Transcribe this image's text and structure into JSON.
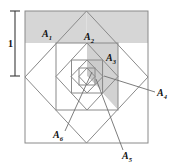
{
  "figure": {
    "dimension_label": "1",
    "colors": {
      "shade": "#d6d6d6",
      "shade_alt": "#cfcfcf",
      "stroke": "#8a8a8a",
      "stroke_dark": "#6e6e6e",
      "label": "#111111",
      "background": "#ffffff"
    },
    "outer_square": {
      "x": 25,
      "y": 11,
      "width": 123,
      "height": 132
    },
    "labels": [
      {
        "id": "A1",
        "base": "A",
        "sub": "1",
        "x": 47,
        "y": 34,
        "leader": false
      },
      {
        "id": "A2",
        "base": "A",
        "sub": "2",
        "x": 88,
        "y": 38,
        "leader": false
      },
      {
        "id": "A3",
        "base": "A",
        "sub": "3",
        "x": 110,
        "y": 59,
        "leader": false
      },
      {
        "id": "A4",
        "base": "A",
        "sub": "4",
        "x": 159,
        "y": 95,
        "leader": true
      },
      {
        "id": "A5",
        "base": "A",
        "sub": "5",
        "x": 125,
        "y": 157,
        "leader": true
      },
      {
        "id": "A6",
        "base": "A",
        "sub": "6",
        "x": 57,
        "y": 137,
        "leader": true
      }
    ],
    "leader_lines": [
      {
        "for": "A4",
        "x1": 155,
        "y1": 92,
        "x2": 104,
        "y2": 76
      },
      {
        "for": "A5",
        "x1": 123,
        "y1": 150,
        "x2": 96,
        "y2": 79
      },
      {
        "for": "A6",
        "x1": 65,
        "y1": 131,
        "x2": 92,
        "y2": 72
      }
    ],
    "dimension_bar": {
      "x": 15,
      "y_top": 11,
      "y_bottom": 76,
      "value": "1"
    }
  }
}
